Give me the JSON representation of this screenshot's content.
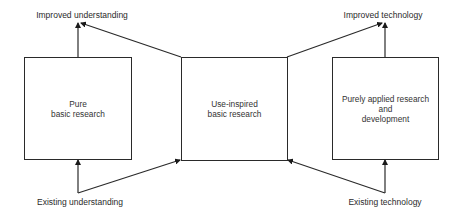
{
  "diagram": {
    "type": "research-quadrant-flow",
    "boxes": [
      {
        "id": "pure-basic",
        "label": "Pure\nbasic research"
      },
      {
        "id": "use-inspired",
        "label": "Use-inspired\nbasic research"
      },
      {
        "id": "applied",
        "label": "Purely applied research\nand\ndevelopment"
      }
    ],
    "labels": {
      "top_left": "Improved understanding",
      "top_right": "Improved technology",
      "bottom_left": "Existing understanding",
      "bottom_right": "Existing technology"
    },
    "edges": [
      {
        "from": "Existing understanding",
        "to": "Pure basic research"
      },
      {
        "from": "Existing understanding",
        "to": "Use-inspired basic research"
      },
      {
        "from": "Pure basic research",
        "to": "Improved understanding"
      },
      {
        "from": "Use-inspired basic research",
        "to": "Improved understanding"
      },
      {
        "from": "Use-inspired basic research",
        "to": "Improved technology"
      },
      {
        "from": "Purely applied research and development",
        "to": "Improved technology"
      },
      {
        "from": "Existing technology",
        "to": "Purely applied research and development"
      },
      {
        "from": "Existing technology",
        "to": "Use-inspired basic research"
      }
    ],
    "colors": {
      "line": "#2a2a2a",
      "text": "#333333",
      "background": "#ffffff"
    }
  }
}
